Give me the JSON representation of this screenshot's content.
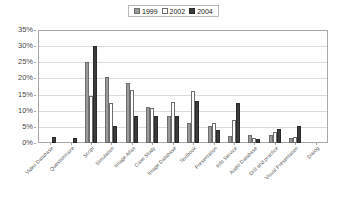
{
  "chart_data": {
    "type": "bar",
    "title": "",
    "xlabel": "",
    "ylabel": "",
    "ylim": [
      0,
      35
    ],
    "ytick_labels": [
      "35%",
      "30%",
      "25%",
      "20%",
      "15%",
      "10%",
      "5%",
      "0%"
    ],
    "ytick_values": [
      35,
      30,
      25,
      20,
      15,
      10,
      5,
      0
    ],
    "grid": true,
    "legend_position": "top-center",
    "categories": [
      "Video Database",
      "Questionnaire",
      "Script",
      "Simulation",
      "Image Atlas",
      "Case Study",
      "Image Database",
      "Textbook",
      "Presentation",
      "Info Service",
      "Audio Database",
      "Drill and practice",
      "Visual Presentation",
      "Dialog"
    ],
    "series": [
      {
        "name": "1999",
        "color": "#9a9a9a",
        "values": [
          0,
          0,
          25.0,
          20.3,
          18.5,
          11.3,
          8.3,
          6.3,
          5.4,
          2.3,
          2.4,
          2.6,
          1.7,
          0
        ]
      },
      {
        "name": "2002",
        "color": "#ffffff",
        "values": [
          0,
          0,
          14.5,
          12.3,
          16.5,
          11.0,
          12.7,
          16.2,
          6.1,
          7.1,
          1.7,
          3.4,
          2.0,
          0
        ]
      },
      {
        "name": "2004",
        "color": "#3b3b3b",
        "values": [
          2.0,
          1.5,
          30.0,
          5.2,
          8.3,
          8.5,
          8.4,
          13.0,
          3.9,
          12.4,
          1.3,
          4.4,
          5.2,
          0
        ]
      }
    ]
  },
  "legend": {
    "entries": [
      {
        "label": "1999"
      },
      {
        "label": "2002"
      },
      {
        "label": "2004"
      }
    ]
  }
}
